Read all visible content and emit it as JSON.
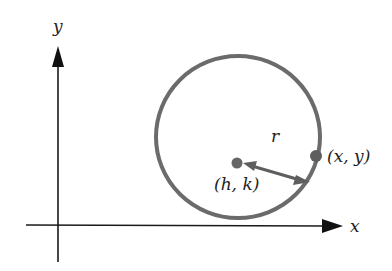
{
  "diagram": {
    "axes": {
      "x_label": "x",
      "y_label": "y"
    },
    "center_label": "(h, k)",
    "point_label": "(x, y)",
    "radius_label": "r",
    "colors": {
      "axis": "#1a1a1a",
      "circle": "#6b6b6b",
      "radius": "#5e5e5e",
      "text": "#222222"
    }
  }
}
